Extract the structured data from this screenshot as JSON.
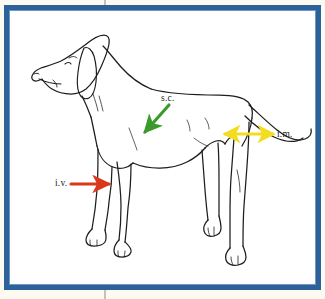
{
  "figure": {
    "name": "dog-injection-routes-diagram",
    "frame_color": "#2d6199",
    "page_color": "#fdfaf1",
    "canvas_color": "#ffffff",
    "ink_color": "#1d1d1b"
  },
  "annotations": [
    {
      "id": "sc",
      "label": "s.c.",
      "color": "#3a9a2a",
      "arrow": "single-head",
      "direction": "down-left",
      "target": "shoulder-scruff"
    },
    {
      "id": "im",
      "label": "i.m.",
      "color": "#f2dd1e",
      "arrow": "double-head",
      "direction": "horizontal",
      "target": "hip-thigh"
    },
    {
      "id": "iv",
      "label": "i.v.",
      "color": "#d8391a",
      "arrow": "single-head",
      "direction": "right",
      "target": "foreleg-cephalic-vein"
    }
  ]
}
